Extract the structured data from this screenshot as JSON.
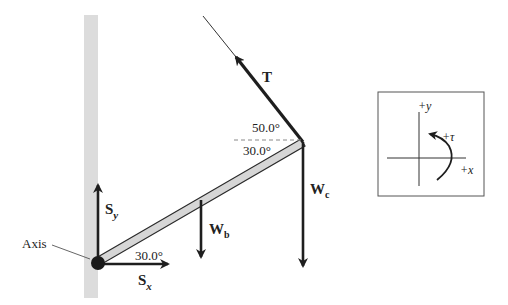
{
  "diagram": {
    "colors": {
      "wall": "#dcdcdc",
      "beam_fill": "#d6d6d6",
      "ink": "#1e1e1e",
      "dashed": "#888888"
    },
    "labels": {
      "tension": "T",
      "angle_cable": "50.0°",
      "angle_beam_top": "30.0°",
      "angle_beam_bottom": "30.0°",
      "weight_crate_main": "W",
      "weight_crate_sub": "c",
      "weight_beam_main": "W",
      "weight_beam_sub": "b",
      "support_y_main": "S",
      "support_y_sub": "y",
      "support_x_main": "S",
      "support_x_sub": "x",
      "axis": "Axis"
    },
    "inset": {
      "y_axis_label": "+y",
      "x_axis_label": "+x",
      "torque_label": "+τ"
    }
  }
}
